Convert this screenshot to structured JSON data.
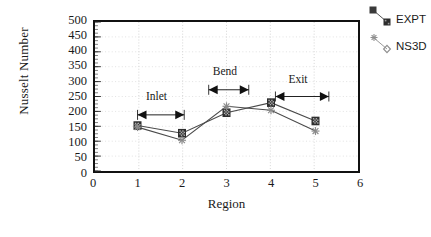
{
  "chart_data": {
    "type": "line",
    "title": "",
    "xlabel": "Region",
    "ylabel": "Nusselt Number",
    "x": [
      1,
      2,
      3,
      4,
      5
    ],
    "categories": [
      "1",
      "2",
      "3",
      "4",
      "5"
    ],
    "xlim": [
      0,
      6
    ],
    "ylim": [
      0,
      500
    ],
    "xticks": [
      "0",
      "1",
      "2",
      "3",
      "4",
      "5",
      "6"
    ],
    "yticks": [
      "0",
      "50",
      "100",
      "150",
      "200",
      "250",
      "300",
      "350",
      "400",
      "450",
      "500"
    ],
    "grid": "dotted-light",
    "legend_position": "outside-right-top",
    "series": [
      {
        "name": "EXPT",
        "marker": "filled-square",
        "color": "#303030",
        "values": [
          155,
          130,
          197,
          230,
          170
        ]
      },
      {
        "name": "NS3D",
        "marker": "star-diamond",
        "color": "#8a8a8a",
        "values": [
          150,
          107,
          218,
          205,
          137
        ]
      }
    ],
    "annotations": [
      {
        "label": "Inlet",
        "x_start": 1.0,
        "x_end": 2.05,
        "y": 190,
        "label_x": 1.55,
        "label_y": 250
      },
      {
        "label": "Bend",
        "x_start": 2.6,
        "x_end": 3.5,
        "y": 272,
        "label_x": 3.05,
        "label_y": 330
      },
      {
        "label": "Exit",
        "x_start": 4.1,
        "x_end": 5.3,
        "y": 250,
        "label_x": 4.75,
        "label_y": 305
      }
    ]
  },
  "axes": {
    "y_title": "Nusselt Number",
    "x_title": "Region",
    "y_ticks": [
      "500",
      "450",
      "400",
      "350",
      "300",
      "250",
      "200",
      "150",
      "100",
      "50",
      "0"
    ],
    "x_ticks": [
      "0",
      "1",
      "2",
      "3",
      "4",
      "5",
      "6"
    ]
  },
  "legend": {
    "items": [
      {
        "label": "EXPT",
        "marker": "filled-square-marker",
        "color": "#303030"
      },
      {
        "label": "NS3D",
        "marker": "star-diamond-marker",
        "color": "#8f8f8f"
      }
    ]
  },
  "annotations": {
    "inlet": "Inlet",
    "bend": "Bend",
    "exit": "Exit"
  }
}
